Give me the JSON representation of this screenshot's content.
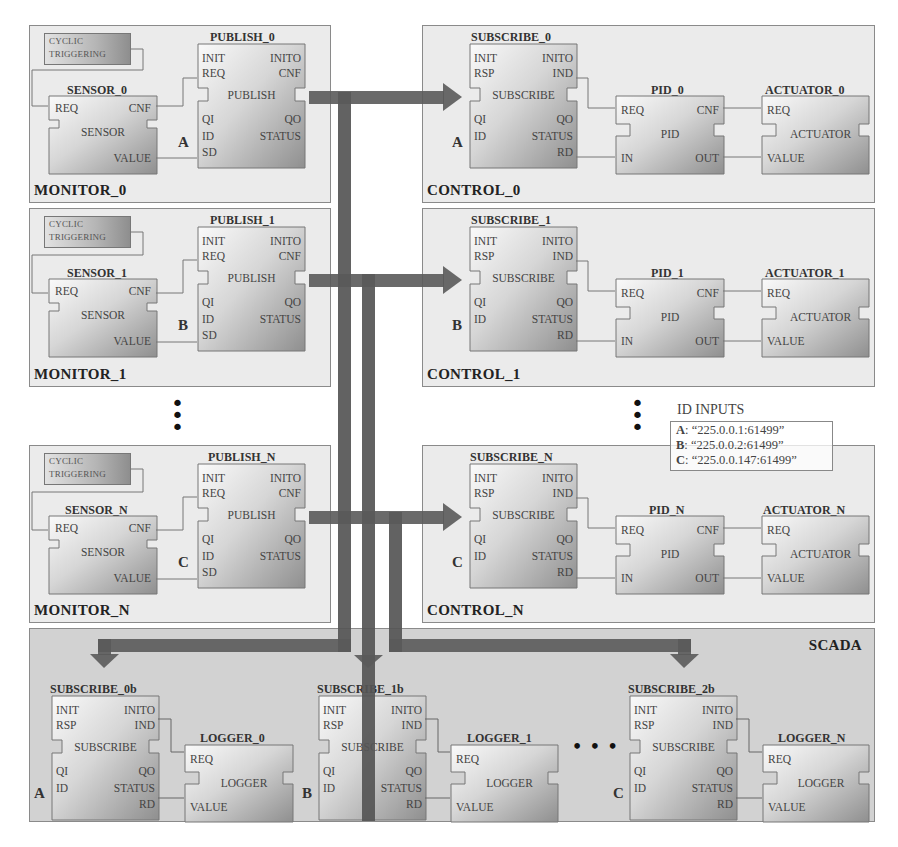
{
  "monitors": [
    {
      "label": "MONITOR_0",
      "cyclic": [
        "CYCLIC",
        "TRIGGERING"
      ],
      "sensor_title": "SENSOR_0",
      "publish_title": "PUBLISH_0",
      "id_label": "A"
    },
    {
      "label": "MONITOR_1",
      "cyclic": [
        "CYCLIC",
        "TRIGGERING"
      ],
      "sensor_title": "SENSOR_1",
      "publish_title": "PUBLISH_1",
      "id_label": "B"
    },
    {
      "label": "MONITOR_N",
      "cyclic": [
        "CYCLIC",
        "TRIGGERING"
      ],
      "sensor_title": "SENSOR_N",
      "publish_title": "PUBLISH_N",
      "id_label": "C"
    }
  ],
  "controls": [
    {
      "label": "CONTROL_0",
      "subscribe_title": "SUBSCRIBE_0",
      "pid_title": "PID_0",
      "actuator_title": "ACTUATOR_0",
      "id_label": "A"
    },
    {
      "label": "CONTROL_1",
      "subscribe_title": "SUBSCRIBE_1",
      "pid_title": "PID_1",
      "actuator_title": "ACTUATOR_1",
      "id_label": "B"
    },
    {
      "label": "CONTROL_N",
      "subscribe_title": "SUBSCRIBE_N",
      "pid_title": "PID_N",
      "actuator_title": "ACTUATOR_N",
      "id_label": "C"
    }
  ],
  "scada": {
    "label": "SCADA",
    "groups": [
      {
        "subscribe_title": "SUBSCRIBE_0b",
        "logger_title": "LOGGER_0",
        "id_label": "A"
      },
      {
        "subscribe_title": "SUBSCRIBE_1b",
        "logger_title": "LOGGER_1",
        "id_label": "B"
      },
      {
        "subscribe_title": "SUBSCRIBE_2b",
        "logger_title": "LOGGER_N",
        "id_label": "C"
      }
    ],
    "ellipsis": "• • •"
  },
  "blocks": {
    "sensor": {
      "type": "SENSOR",
      "in": [
        "REQ"
      ],
      "out": [
        "CNF",
        "VALUE"
      ]
    },
    "publish": {
      "type": "PUBLISH",
      "events_in": [
        "INIT",
        "REQ"
      ],
      "events_out": [
        "INITO",
        "CNF"
      ],
      "data_in": [
        "QI",
        "ID",
        "SD"
      ],
      "data_out": [
        "QO",
        "STATUS"
      ]
    },
    "subscribe": {
      "type": "SUBSCRIBE",
      "events_in": [
        "INIT",
        "RSP"
      ],
      "events_out": [
        "INITO",
        "IND"
      ],
      "data_in": [
        "QI",
        "ID"
      ],
      "data_out": [
        "QO",
        "STATUS",
        "RD"
      ]
    },
    "pid": {
      "type": "PID",
      "in": [
        "REQ",
        "IN"
      ],
      "out": [
        "CNF",
        "OUT"
      ]
    },
    "actuator": {
      "type": "ACTUATOR",
      "in": [
        "REQ",
        "VALUE"
      ]
    },
    "logger": {
      "type": "LOGGER",
      "in": [
        "REQ",
        "VALUE"
      ]
    }
  },
  "id_inputs": {
    "title": "ID INPUTS",
    "entries": [
      {
        "key": "A",
        "value": ": “225.0.0.1:61499”"
      },
      {
        "key": "B",
        "value": ": “225.0.0.2:61499”"
      },
      {
        "key": "C",
        "value": ": “225.0.0.147:61499”"
      }
    ]
  },
  "vertical_ellipsis": "⋮",
  "colors": {
    "panel_bg": "#ebebeb",
    "scada_bg": "#d2d2d2",
    "arrow": "#555555",
    "border": "#8a8a8a"
  }
}
